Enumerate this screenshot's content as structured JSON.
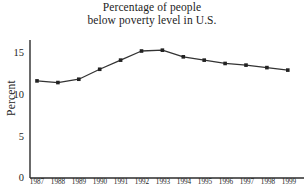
{
  "chart_data": {
    "type": "line",
    "title": "Percentage of people below poverty level in U.S.",
    "title_lines": [
      "Percentage of people",
      "below poverty level in U.S."
    ],
    "xlabel": "",
    "ylabel": "Percent",
    "categories": [
      "1987",
      "1988",
      "1989",
      "1990",
      "1991",
      "1992",
      "1993",
      "1994",
      "1995",
      "1996",
      "1997",
      "1998",
      "1999"
    ],
    "values": [
      11.7,
      11.5,
      11.9,
      13.1,
      14.2,
      15.3,
      15.4,
      14.6,
      14.2,
      13.8,
      13.6,
      13.3,
      13.0
    ],
    "x": [
      1987,
      1988,
      1989,
      1990,
      1991,
      1992,
      1993,
      1994,
      1995,
      1996,
      1997,
      1998,
      1999
    ],
    "yticks": [
      0,
      5,
      10,
      15
    ],
    "ytick_labels": [
      "0",
      "5",
      "10",
      "15"
    ],
    "ylim": [
      0,
      17.2
    ],
    "xlim": [
      1986.5,
      1999.6
    ],
    "grid": false,
    "legend": false,
    "marker": "square",
    "line_color": "#333333",
    "marker_color": "#222222",
    "axis_color": "#2b2b2b",
    "background": "#ffffff"
  }
}
